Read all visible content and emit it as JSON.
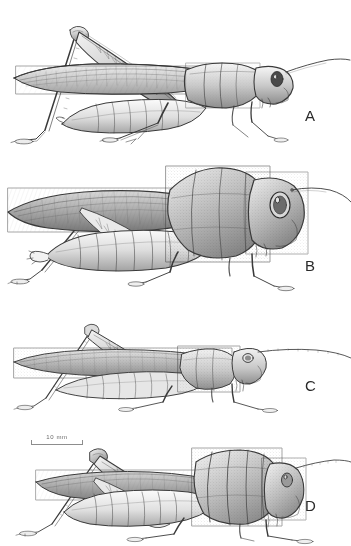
{
  "plate": {
    "title": "Grasshopper lateral view comparative plate",
    "background_color": "#ffffff",
    "ink_color": "#3a3a3a",
    "width": 351,
    "height": 546
  },
  "scale_bar": {
    "label": "10 mm",
    "value": 10,
    "unit": "mm",
    "pixel_length": 52,
    "color": "#8d8d8d"
  },
  "panels": [
    {
      "label": "A",
      "label_x": 305,
      "label_y": 108,
      "top": 8,
      "height": 140,
      "description": "Grasshopper in left lateral view, slender body, long folded tegmina reaching past abdomen tip, hind femur raised at steep angle, short antennae angled upward and back",
      "antenna_style": "short-filiform",
      "pronotum_style": "smooth-saddle",
      "body_tone": "light"
    },
    {
      "label": "B",
      "label_x": 305,
      "label_y": 258,
      "top": 150,
      "height": 150,
      "description": "Robust grasshopper in left lateral view, very large rounded head and swollen pronotum, broad dark tegmina, hind femur laid low along body, long slender antenna sweeping backward",
      "antenna_style": "long-filiform",
      "pronotum_style": "inflated-globose",
      "body_tone": "dark"
    },
    {
      "label": "C",
      "label_x": 305,
      "label_y": 378,
      "top": 312,
      "height": 118,
      "description": "Slender elongate grasshopper in left lateral view, narrow conical head, very long filiform antenna extending well past body, low slim thorax and long narrow tegmina",
      "antenna_style": "very-long-filiform",
      "pronotum_style": "narrow-ridged",
      "body_tone": "medium"
    },
    {
      "label": "D",
      "label_x": 305,
      "label_y": 498,
      "top": 440,
      "height": 106,
      "description": "Stout grasshopper in left lateral view below the scale bar, heavily ridged and rugose pronotum, short antenna, broad hind femur angled up, tegmina shorter than abdomen",
      "antenna_style": "short-filiform",
      "pronotum_style": "rugose-ridged",
      "body_tone": "dark"
    }
  ]
}
